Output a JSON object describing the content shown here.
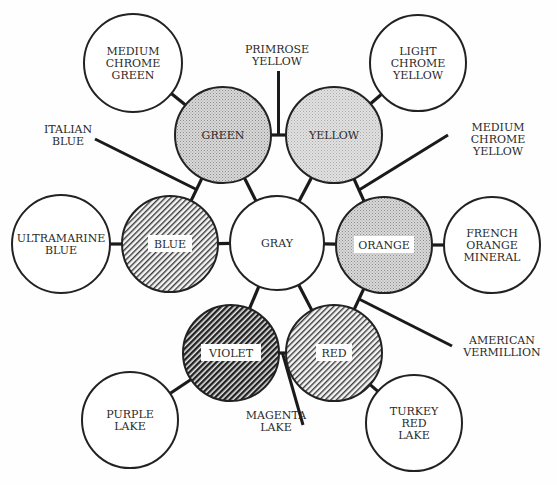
{
  "center": {
    "name": "GRAY",
    "cx": 277,
    "cy": 243,
    "r": 47
  },
  "primary_secondary": [
    {
      "name": "GREEN",
      "cx": 223,
      "cy": 135,
      "r": 48,
      "fill": "dots-light"
    },
    {
      "name": "YELLOW",
      "cx": 334,
      "cy": 135,
      "r": 48,
      "fill": "dots-lighter"
    },
    {
      "name": "ORANGE",
      "cx": 384,
      "cy": 245,
      "r": 48,
      "fill": "dots-light"
    },
    {
      "name": "RED",
      "cx": 334,
      "cy": 353,
      "r": 48,
      "fill": "hatch-light"
    },
    {
      "name": "VIOLET",
      "cx": 231,
      "cy": 353,
      "r": 48,
      "fill": "hatch-dark"
    },
    {
      "name": "BLUE",
      "cx": 170,
      "cy": 244,
      "r": 48,
      "fill": "hatch-light"
    }
  ],
  "pigment_circles": [
    {
      "lines": [
        "MEDIUM",
        "CHROME",
        "GREEN"
      ],
      "cx": 133,
      "cy": 63,
      "r": 49,
      "attached_to": "GREEN"
    },
    {
      "lines": [
        "LIGHT",
        "CHROME",
        "YELLOW"
      ],
      "cx": 418,
      "cy": 63,
      "r": 48,
      "attached_to": "YELLOW"
    },
    {
      "lines": [
        "FRENCH",
        "ORANGE",
        "MINERAL"
      ],
      "cx": 492,
      "cy": 245,
      "r": 48,
      "attached_to": "ORANGE"
    },
    {
      "lines": [
        "TURKEY",
        "RED",
        "LAKE"
      ],
      "cx": 414,
      "cy": 423,
      "r": 48,
      "attached_to": "RED"
    },
    {
      "lines": [
        "PURPLE",
        "LAKE"
      ],
      "cx": 130,
      "cy": 420,
      "r": 48,
      "attached_to": "VIOLET"
    },
    {
      "lines": [
        "ULTRAMARINE",
        "BLUE"
      ],
      "cx": 61,
      "cy": 244,
      "r": 49,
      "attached_to": "BLUE"
    }
  ],
  "leader_labels": [
    {
      "lines": [
        "PRIMROSE",
        "YELLOW"
      ],
      "x": 277,
      "y": 53,
      "between": [
        "GREEN",
        "YELLOW"
      ]
    },
    {
      "lines": [
        "MEDIUM",
        "CHROME",
        "YELLOW"
      ],
      "x": 498,
      "y": 131,
      "between": [
        "YELLOW",
        "ORANGE"
      ]
    },
    {
      "lines": [
        "AMERICAN",
        "VERMILLION"
      ],
      "x": 502,
      "y": 344,
      "between": [
        "ORANGE",
        "RED"
      ]
    },
    {
      "lines": [
        "MAGENTA",
        "LAKE"
      ],
      "x": 276,
      "y": 419,
      "between": [
        "RED",
        "VIOLET"
      ]
    },
    {
      "lines": [
        "ITALIAN",
        "BLUE"
      ],
      "x": 68,
      "y": 133,
      "between": [
        "BLUE",
        "GREEN"
      ]
    }
  ],
  "colors": {
    "stroke": "#222222",
    "text": "#2a2a2a",
    "dots_light": "#c9c9c9",
    "dots_lighter": "#d6d6d6",
    "hatch_light": "#6a6a6a",
    "hatch_dark": "#2c2c2c"
  }
}
